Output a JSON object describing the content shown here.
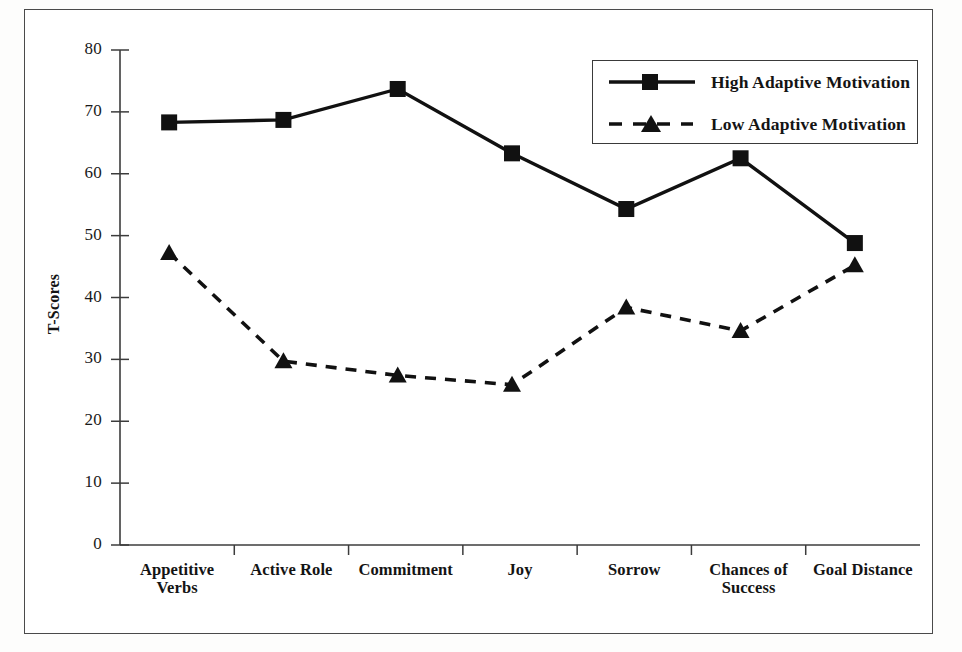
{
  "chart_data": {
    "type": "line",
    "title": "",
    "xlabel": "",
    "ylabel": "T-Scores",
    "ylim": [
      0,
      80
    ],
    "yticks": [
      0,
      10,
      20,
      30,
      40,
      50,
      60,
      70,
      80
    ],
    "grid": false,
    "legend_position": "top-right",
    "categories": [
      "Appetitive Verbs",
      "Active Role",
      "Commitment",
      "Joy",
      "Sorrow",
      "Chances of Success",
      "Goal Distance"
    ],
    "category_lines": [
      [
        "Appetitive",
        "Verbs"
      ],
      [
        "Active Role"
      ],
      [
        "Commitment"
      ],
      [
        "Joy"
      ],
      [
        "Sorrow"
      ],
      [
        "Chances of",
        "Success"
      ],
      [
        "Goal Distance"
      ]
    ],
    "series": [
      {
        "name": "High Adaptive Motivation",
        "marker": "square",
        "linestyle": "solid",
        "color": "#111111",
        "values": [
          68.3,
          68.7,
          73.7,
          63.3,
          54.3,
          62.5,
          48.8
        ]
      },
      {
        "name": "Low Adaptive Motivation",
        "marker": "triangle",
        "linestyle": "dashed",
        "color": "#111111",
        "values": [
          47.2,
          29.7,
          27.4,
          25.9,
          38.4,
          34.6,
          45.2
        ]
      }
    ]
  },
  "axes": {
    "y_tick_labels": [
      "80",
      "70",
      "60",
      "50",
      "40",
      "30",
      "20",
      "10",
      "0"
    ],
    "y_axis_title": "T-Scores"
  },
  "legend": {
    "entries": [
      {
        "label": "High Adaptive Motivation",
        "marker": "square-marker",
        "style": "solid-line"
      },
      {
        "label": "Low Adaptive Motivation",
        "marker": "triangle-marker",
        "style": "dashed-line"
      }
    ]
  }
}
